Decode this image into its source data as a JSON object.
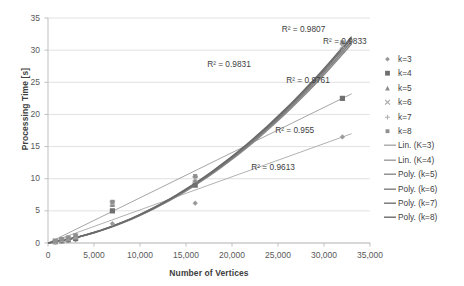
{
  "chart_data": {
    "type": "scatter",
    "title": "",
    "xlabel": "Number of Vertices",
    "ylabel": "Processing Time [s]",
    "xlim": [
      0,
      35000
    ],
    "ylim": [
      0,
      35
    ],
    "xticks": [
      "0",
      "5,000",
      "10,000",
      "15,000",
      "20,000",
      "25,000",
      "30,000",
      "35,000"
    ],
    "xtick_values": [
      0,
      5000,
      10000,
      15000,
      20000,
      25000,
      30000,
      35000
    ],
    "yticks": [
      "0",
      "5",
      "10",
      "15",
      "20",
      "25",
      "30",
      "35"
    ],
    "ytick_values": [
      0,
      5,
      10,
      15,
      20,
      25,
      30,
      35
    ],
    "grid": "horizontal",
    "legend_position": "right",
    "series": [
      {
        "name": "k=3",
        "marker": "diamond",
        "color": "#9a9a9a",
        "points": [
          [
            800,
            0.15
          ],
          [
            1500,
            0.25
          ],
          [
            2200,
            0.35
          ],
          [
            3000,
            0.5
          ],
          [
            7000,
            3.0
          ],
          [
            16000,
            6.2
          ],
          [
            32000,
            16.5
          ]
        ]
      },
      {
        "name": "k=4",
        "marker": "square",
        "color": "#6f6f6f",
        "points": [
          [
            800,
            0.2
          ],
          [
            1500,
            0.35
          ],
          [
            2200,
            0.5
          ],
          [
            3000,
            0.7
          ],
          [
            7000,
            5.0
          ],
          [
            16000,
            9.0
          ],
          [
            32000,
            22.5
          ]
        ]
      },
      {
        "name": "k=5",
        "marker": "triangle",
        "color": "#8c8c8c",
        "points": [
          [
            800,
            0.25
          ],
          [
            1500,
            0.45
          ],
          [
            2200,
            0.65
          ],
          [
            3000,
            0.9
          ],
          [
            7000,
            6.0
          ],
          [
            16000,
            9.8
          ],
          [
            32000,
            30.0
          ]
        ]
      },
      {
        "name": "k=6",
        "marker": "cross",
        "color": "#a6a6a6",
        "points": [
          [
            800,
            0.3
          ],
          [
            1500,
            0.5
          ],
          [
            2200,
            0.7
          ],
          [
            3000,
            1.0
          ],
          [
            7000,
            6.2
          ],
          [
            16000,
            10.0
          ],
          [
            32000,
            30.6
          ]
        ]
      },
      {
        "name": "k=7",
        "marker": "plus",
        "color": "#b0b0b0",
        "points": [
          [
            800,
            0.3
          ],
          [
            1500,
            0.55
          ],
          [
            2200,
            0.8
          ],
          [
            3000,
            1.1
          ],
          [
            7000,
            6.3
          ],
          [
            16000,
            10.2
          ],
          [
            32000,
            31.0
          ]
        ]
      },
      {
        "name": "k=8",
        "marker": "small-square",
        "color": "#8f8f8f",
        "points": [
          [
            800,
            0.35
          ],
          [
            1500,
            0.6
          ],
          [
            2200,
            0.85
          ],
          [
            3000,
            1.2
          ],
          [
            7000,
            6.4
          ],
          [
            16000,
            10.4
          ],
          [
            32000,
            31.2
          ]
        ]
      }
    ],
    "trendlines": [
      {
        "name": "Lin. (K=3)",
        "type": "linear",
        "color": "#a8a8a8",
        "from": [
          0,
          0
        ],
        "to": [
          33000,
          17.0
        ]
      },
      {
        "name": "Lin. (K=4)",
        "type": "linear",
        "color": "#9b9b9b",
        "from": [
          0,
          0
        ],
        "to": [
          33000,
          23.2
        ]
      },
      {
        "name": "Poly. (k=5)",
        "type": "poly",
        "color": "#8a8a8a",
        "end": [
          33000,
          31.0
        ]
      },
      {
        "name": "Poly. (k=6)",
        "type": "poly",
        "color": "#7d7d7d",
        "end": [
          33000,
          31.4
        ]
      },
      {
        "name": "Poly. (k=7)",
        "type": "poly",
        "color": "#727272",
        "end": [
          33000,
          31.8
        ]
      },
      {
        "name": "Poly. (k=8)",
        "type": "poly",
        "color": "#6a6a6a",
        "end": [
          33000,
          32.1
        ]
      }
    ],
    "annotations": [
      {
        "text": "R² = 0.9807",
        "x": 25400,
        "y": 33.2
      },
      {
        "text": "R² = 0.9833",
        "x": 29900,
        "y": 31.3
      },
      {
        "text": "R² = 0.9831",
        "x": 17300,
        "y": 27.7
      },
      {
        "text": "R² = 0.9761",
        "x": 25900,
        "y": 25.2
      },
      {
        "text": "R² = 0.955",
        "x": 24700,
        "y": 17.4
      },
      {
        "text": "R² = 0.9613",
        "x": 22100,
        "y": 11.6
      }
    ],
    "legend": [
      {
        "label": "k=3",
        "marker": "diamond"
      },
      {
        "label": "k=4",
        "marker": "square"
      },
      {
        "label": "k=5",
        "marker": "triangle"
      },
      {
        "label": "k=6",
        "marker": "cross"
      },
      {
        "label": "k=7",
        "marker": "plus"
      },
      {
        "label": "k=8",
        "marker": "small-square"
      },
      {
        "label": "Lin. (K=3)",
        "marker": "line"
      },
      {
        "label": "Lin. (K=4)",
        "marker": "line"
      },
      {
        "label": "Poly. (k=5)",
        "marker": "line"
      },
      {
        "label": "Poly. (k=6)",
        "marker": "line"
      },
      {
        "label": "Poly. (k=7)",
        "marker": "line"
      },
      {
        "label": "Poly. (k=8)",
        "marker": "line"
      }
    ],
    "colors": {
      "grid": "#d9d9d9",
      "axis": "#bfbfbf",
      "text": "#595959",
      "annotation": "#404040"
    }
  }
}
